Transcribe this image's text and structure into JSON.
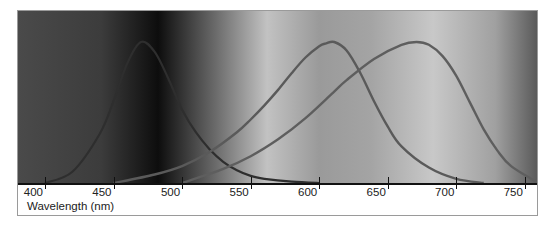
{
  "chart_data": {
    "type": "line",
    "title": "",
    "xlabel": "Wavelength (nm)",
    "ylabel": "",
    "xlim": [
      380,
      760
    ],
    "ylim": [
      0,
      1
    ],
    "grid": false,
    "legend": null,
    "x_ticks": [
      400,
      450,
      500,
      550,
      600,
      650,
      700,
      750
    ],
    "background": "grayscale visible spectrum gradient",
    "series": [
      {
        "name": "S-cone (short wavelength)",
        "peak_nm": 470,
        "x": [
          400,
          420,
          440,
          450,
          460,
          470,
          480,
          490,
          500,
          510,
          520,
          530,
          540,
          550,
          560,
          580,
          600
        ],
        "values": [
          0.0,
          0.08,
          0.35,
          0.58,
          0.85,
          1.0,
          0.93,
          0.74,
          0.52,
          0.36,
          0.24,
          0.15,
          0.09,
          0.05,
          0.03,
          0.01,
          0.0
        ]
      },
      {
        "name": "M-cone (medium wavelength)",
        "peak_nm": 611,
        "x": [
          450,
          480,
          500,
          520,
          540,
          550,
          560,
          570,
          580,
          590,
          600,
          605,
          611,
          620,
          630,
          640,
          650,
          660,
          680,
          700,
          720
        ],
        "values": [
          0.0,
          0.06,
          0.12,
          0.22,
          0.36,
          0.45,
          0.55,
          0.66,
          0.78,
          0.89,
          0.97,
          0.99,
          1.0,
          0.94,
          0.78,
          0.58,
          0.4,
          0.26,
          0.11,
          0.03,
          0.0
        ]
      },
      {
        "name": "L-cone (long wavelength)",
        "peak_nm": 671,
        "x": [
          500,
          530,
          550,
          570,
          590,
          610,
          620,
          640,
          660,
          671,
          680,
          690,
          700,
          710,
          720,
          730,
          740,
          760
        ],
        "values": [
          0.0,
          0.1,
          0.19,
          0.31,
          0.46,
          0.64,
          0.73,
          0.88,
          0.98,
          1.0,
          0.98,
          0.9,
          0.76,
          0.57,
          0.38,
          0.23,
          0.12,
          0.0
        ]
      }
    ]
  },
  "axis": {
    "label": "Wavelength (nm)",
    "ticks": [
      "400",
      "450",
      "500",
      "550",
      "600",
      "650",
      "700",
      "750"
    ]
  },
  "colors": {
    "curve_stroke": "#3a3a3a",
    "axis": "#111111",
    "frame": "#9a9a9a",
    "spectrum_stops": [
      "#4a4a4a",
      "#3c3c3c",
      "#0d0d0d",
      "#6a6a6a",
      "#c2c2c2",
      "#9a9a9a",
      "#a4a4a4",
      "#c8c8c8",
      "#a0a0a0",
      "#5a5a5a"
    ]
  }
}
